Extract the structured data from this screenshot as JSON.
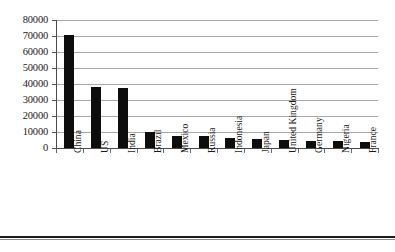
{
  "chart_data": {
    "type": "bar",
    "title": "",
    "subtitle": "",
    "xlabel": "",
    "ylabel": "",
    "grid": true,
    "legend": false,
    "legend_position": "none",
    "orientation": "vertical",
    "bar_color": "#0d0d0d",
    "gridline_color": "#a8a8a8",
    "axis_color": "#4a4a4a",
    "background_color": "#ffffff",
    "ylim": [
      0,
      80000
    ],
    "ytick_step": 10000,
    "ytick_labels": [
      "0",
      "10000",
      "20000",
      "30000",
      "40000",
      "50000",
      "60000",
      "70000",
      "80000"
    ],
    "ytick_values": [
      0,
      10000,
      20000,
      30000,
      40000,
      50000,
      60000,
      70000,
      80000
    ],
    "categories": [
      "China",
      "US",
      "India",
      "Brazil",
      "Mexico",
      "Russia",
      "Indonesia",
      "Japan",
      "United Kingdom",
      "Germany",
      "Nigeria",
      "France"
    ],
    "values": [
      70500,
      38000,
      37500,
      10000,
      7800,
      7200,
      6200,
      5800,
      5000,
      4600,
      4200,
      3800
    ],
    "series": [
      {
        "name": "Value",
        "values": [
          70500,
          38000,
          37500,
          10000,
          7800,
          7200,
          6200,
          5800,
          5000,
          4600,
          4200,
          3800
        ]
      }
    ]
  },
  "figure": {
    "bottom_rule_present": true
  }
}
